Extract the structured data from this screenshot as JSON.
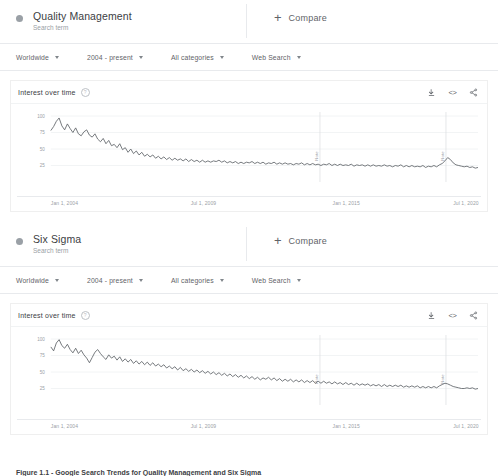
{
  "panels": [
    {
      "term": "Quality Management",
      "subtitle": "Search term",
      "compare_label": "Compare",
      "filters": [
        {
          "label": "Worldwide"
        },
        {
          "label": "2004 - present"
        },
        {
          "label": "All categories"
        },
        {
          "label": "Web Search"
        }
      ],
      "card": {
        "title": "Interest over time",
        "help_icon": "help-icon",
        "actions": [
          {
            "name": "download-icon"
          },
          {
            "name": "embed-icon",
            "glyph": "<>"
          },
          {
            "name": "share-icon"
          }
        ]
      },
      "chart_data": {
        "type": "line",
        "title": "Interest over time",
        "xlabel": "",
        "ylabel": "",
        "ylim": [
          0,
          100
        ],
        "yticks": [
          100,
          75,
          50,
          25
        ],
        "xticks": [
          "Jan 1, 2004",
          "Jul 1, 2009",
          "Jan 1, 2015",
          "Jul 1, 2020"
        ],
        "grid": true,
        "legend": "none",
        "line_color": "#5f6368",
        "annotations": [
          {
            "label": "Note",
            "x_fraction": 0.63
          },
          {
            "label": "Note",
            "x_fraction": 0.925
          }
        ],
        "series": [
          {
            "name": "Quality Management",
            "values": [
              78,
              84,
              92,
              97,
              85,
              79,
              88,
              81,
              75,
              82,
              73,
              70,
              76,
              79,
              71,
              68,
              73,
              65,
              61,
              66,
              58,
              63,
              55,
              57,
              52,
              58,
              49,
              52,
              45,
              50,
              43,
              47,
              41,
              45,
              39,
              42,
              38,
              41,
              36,
              39,
              35,
              38,
              34,
              37,
              33,
              36,
              33,
              35,
              32,
              35,
              31,
              34,
              31,
              33,
              30,
              33,
              30,
              32,
              30,
              32,
              31,
              33,
              30,
              32,
              29,
              31,
              29,
              31,
              28,
              30,
              28,
              30,
              29,
              31,
              28,
              30,
              28,
              30,
              27,
              29,
              28,
              30,
              27,
              29,
              27,
              29,
              27,
              28,
              26,
              28,
              27,
              29,
              26,
              28,
              26,
              28,
              26,
              27,
              25,
              27,
              26,
              28,
              25,
              27,
              25,
              27,
              25,
              26,
              25,
              27,
              24,
              26,
              25,
              26,
              24,
              26,
              24,
              26,
              24,
              25,
              24,
              26,
              24,
              25,
              23,
              25,
              24,
              26,
              23,
              25,
              23,
              25,
              23,
              24,
              23,
              25,
              22,
              24,
              23,
              25,
              23,
              26,
              28,
              32,
              37,
              34,
              29,
              26,
              25,
              24,
              23,
              24,
              22,
              23,
              21,
              22
            ]
          }
        ]
      }
    },
    {
      "term": "Six Sigma",
      "subtitle": "Search term",
      "compare_label": "Compare",
      "filters": [
        {
          "label": "Worldwide"
        },
        {
          "label": "2004 - present"
        },
        {
          "label": "All categories"
        },
        {
          "label": "Web Search"
        }
      ],
      "card": {
        "title": "Interest over time",
        "help_icon": "help-icon",
        "actions": [
          {
            "name": "download-icon"
          },
          {
            "name": "embed-icon",
            "glyph": "<>"
          },
          {
            "name": "share-icon"
          }
        ]
      },
      "chart_data": {
        "type": "line",
        "title": "Interest over time",
        "xlabel": "",
        "ylabel": "",
        "ylim": [
          0,
          100
        ],
        "yticks": [
          100,
          75,
          50,
          25
        ],
        "xticks": [
          "Jan 1, 2004",
          "Jul 1, 2009",
          "Jan 1, 2015",
          "Jul 1, 2020"
        ],
        "grid": true,
        "legend": "none",
        "line_color": "#5f6368",
        "annotations": [
          {
            "label": "Note",
            "x_fraction": 0.63
          },
          {
            "label": "Note",
            "x_fraction": 0.925
          }
        ],
        "series": [
          {
            "name": "Six Sigma",
            "values": [
              88,
              82,
              94,
              99,
              90,
              86,
              92,
              84,
              79,
              86,
              78,
              83,
              76,
              71,
              64,
              72,
              80,
              84,
              78,
              73,
              69,
              76,
              71,
              74,
              68,
              73,
              66,
              70,
              65,
              69,
              63,
              67,
              62,
              66,
              61,
              65,
              60,
              64,
              59,
              62,
              58,
              61,
              56,
              59,
              55,
              58,
              53,
              57,
              52,
              55,
              51,
              54,
              50,
              53,
              49,
              52,
              48,
              51,
              47,
              50,
              46,
              49,
              45,
              48,
              44,
              47,
              43,
              46,
              42,
              45,
              41,
              44,
              40,
              43,
              39,
              42,
              38,
              41,
              39,
              42,
              38,
              41,
              37,
              40,
              36,
              39,
              36,
              39,
              35,
              38,
              35,
              38,
              34,
              37,
              34,
              37,
              33,
              36,
              33,
              36,
              33,
              35,
              32,
              35,
              32,
              34,
              31,
              34,
              31,
              33,
              30,
              33,
              30,
              32,
              30,
              32,
              29,
              31,
              29,
              31,
              28,
              31,
              28,
              30,
              28,
              30,
              28,
              30,
              27,
              29,
              27,
              29,
              27,
              29,
              26,
              28,
              26,
              28,
              26,
              28,
              26,
              29,
              31,
              33,
              32,
              30,
              28,
              27,
              26,
              25,
              25,
              26,
              25,
              26,
              24,
              25
            ]
          }
        ]
      }
    }
  ],
  "caption": "Figure 1.1 - Google Search Trends for Quality Management and Six Sigma"
}
